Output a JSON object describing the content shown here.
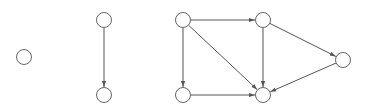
{
  "diagram": {
    "type": "directed-graph",
    "colors": {
      "background": "#ffffff",
      "edge": "#555555",
      "node_stroke": "#666666",
      "node_fill": "#ffffff"
    },
    "node_radius": 7.5,
    "components": [
      {
        "id": "component-1",
        "nodes": [
          "a"
        ],
        "edges": []
      },
      {
        "id": "component-2",
        "nodes": [
          "b",
          "c"
        ],
        "edges": [
          [
            "b",
            "c"
          ]
        ]
      },
      {
        "id": "component-3",
        "nodes": [
          "d",
          "e",
          "f",
          "g",
          "h"
        ],
        "edges": [
          [
            "d",
            "e"
          ],
          [
            "d",
            "f"
          ],
          [
            "d",
            "g"
          ],
          [
            "e",
            "g"
          ],
          [
            "e",
            "h"
          ],
          [
            "f",
            "g"
          ],
          [
            "h",
            "g"
          ]
        ]
      }
    ],
    "nodes": [
      {
        "id": "a",
        "x": 24,
        "y": 57
      },
      {
        "id": "b",
        "x": 104,
        "y": 20
      },
      {
        "id": "c",
        "x": 104,
        "y": 95
      },
      {
        "id": "d",
        "x": 183,
        "y": 20
      },
      {
        "id": "e",
        "x": 263,
        "y": 20
      },
      {
        "id": "f",
        "x": 183,
        "y": 95
      },
      {
        "id": "g",
        "x": 263,
        "y": 95
      },
      {
        "id": "h",
        "x": 343,
        "y": 60
      }
    ],
    "edges": [
      {
        "from": "b",
        "to": "c"
      },
      {
        "from": "d",
        "to": "e"
      },
      {
        "from": "d",
        "to": "f"
      },
      {
        "from": "d",
        "to": "g"
      },
      {
        "from": "e",
        "to": "g"
      },
      {
        "from": "e",
        "to": "h"
      },
      {
        "from": "f",
        "to": "g"
      },
      {
        "from": "h",
        "to": "g"
      }
    ]
  }
}
